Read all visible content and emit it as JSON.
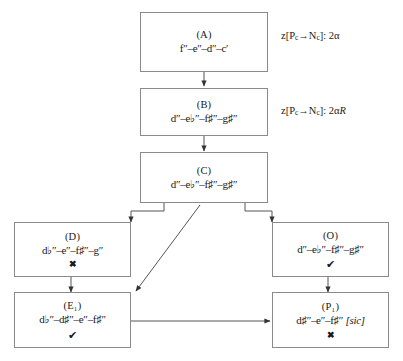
{
  "diagram": {
    "nodes": [
      {
        "id": "A",
        "label": "(A)",
        "formula": "f″–e″–d″–c′",
        "mark": ""
      },
      {
        "id": "B",
        "label": "(B)",
        "formula": "d″–e♭″–f♯″–g♯″",
        "mark": ""
      },
      {
        "id": "C",
        "label": "(C)",
        "formula": "d″–e♭″–f♯″–g♯″",
        "mark": ""
      },
      {
        "id": "D",
        "label": "(D)",
        "formula": "d♭″–e″–f♯″–g″",
        "mark": "✖"
      },
      {
        "id": "O",
        "label": "(O)",
        "formula": "d″–e♭″–f♯″–g♯″",
        "mark": "✔"
      },
      {
        "id": "E1",
        "label": "(E₁)",
        "formula": "d♭″–d♯″–e″–f♯″",
        "mark": "✔"
      },
      {
        "id": "P1",
        "label": "(P₁)",
        "formula": "d♯″–e″–f♯″",
        "formula_suffix": "[sic]",
        "mark": "✖"
      }
    ],
    "annotations": [
      {
        "id": "annot-1",
        "prefix": "z[P",
        "sub1": "c",
        "arrow": "→N",
        "sub2": "c",
        "suffix": "]: 2α",
        "italic_suffix": ""
      },
      {
        "id": "annot-2",
        "prefix": "z[P",
        "sub1": "c",
        "arrow": "→N",
        "sub2": "c",
        "suffix": "]: 2α",
        "italic_suffix": "R"
      }
    ],
    "colors": {
      "box_border": "#8a8a8a",
      "edge": "#555555",
      "text": "#1a1a1a",
      "background": "#ffffff"
    }
  }
}
